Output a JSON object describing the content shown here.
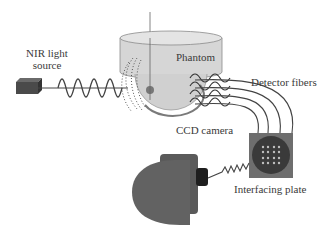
{
  "diagram": {
    "type": "experimental-setup",
    "labels": {
      "nir_source_line1": "NIR light",
      "nir_source_line2": "source",
      "phantom": "Phantom",
      "detector_fibers": "Detector fibers",
      "ccd_camera": "CCD camera",
      "interfacing_plate": "Interfacing plate"
    },
    "components": [
      {
        "id": "nir-light-source",
        "shape": "box",
        "color": "#555555"
      },
      {
        "id": "phantom",
        "shape": "cylinder-with-hemisphere",
        "color": "#d4d4d4"
      },
      {
        "id": "detector-fibers",
        "count": 4,
        "color": "#444444"
      },
      {
        "id": "interfacing-plate",
        "shape": "square-with-circle",
        "dot_grid": "4x4",
        "color": "#6e6e6e"
      },
      {
        "id": "ccd-camera",
        "shape": "camera-body",
        "color": "#606060"
      }
    ],
    "colors": {
      "background": "#ffffff",
      "dark": "#444444",
      "phantom_fill": "#d6d6d6",
      "text": "#3a3a3a"
    }
  }
}
